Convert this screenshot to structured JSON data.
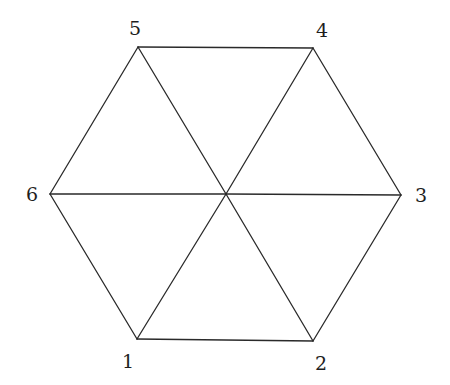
{
  "diagram": {
    "type": "hexagon-triangulation",
    "vertices": [
      {
        "id": "1",
        "label": "1",
        "x": 137,
        "y": 339,
        "label_x": 128,
        "label_y": 368
      },
      {
        "id": "2",
        "label": "2",
        "x": 313,
        "y": 341,
        "label_x": 321,
        "label_y": 370
      },
      {
        "id": "3",
        "label": "3",
        "x": 401,
        "y": 195,
        "label_x": 421,
        "label_y": 202
      },
      {
        "id": "4",
        "label": "4",
        "x": 313,
        "y": 48,
        "label_x": 322,
        "label_y": 37
      },
      {
        "id": "5",
        "label": "5",
        "x": 138,
        "y": 47,
        "label_x": 135,
        "label_y": 35
      },
      {
        "id": "6",
        "label": "6",
        "x": 50,
        "y": 194,
        "label_x": 32,
        "label_y": 201
      },
      {
        "id": "center",
        "label": "",
        "x": 226,
        "y": 194
      }
    ],
    "edges": [
      [
        "1",
        "2"
      ],
      [
        "2",
        "3"
      ],
      [
        "3",
        "4"
      ],
      [
        "4",
        "5"
      ],
      [
        "5",
        "6"
      ],
      [
        "6",
        "1"
      ],
      [
        "1",
        "center"
      ],
      [
        "2",
        "center"
      ],
      [
        "3",
        "center"
      ],
      [
        "4",
        "center"
      ],
      [
        "5",
        "center"
      ],
      [
        "6",
        "center"
      ]
    ],
    "colors": {
      "stroke": "#2a2a2a",
      "label": "#1e1e1e",
      "background": "#ffffff"
    }
  }
}
